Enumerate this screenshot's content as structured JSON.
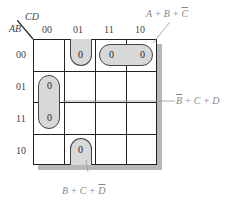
{
  "kmap": {
    "row_var": "AB",
    "col_var": "CD",
    "col_headers": [
      "00",
      "01",
      "11",
      "10"
    ],
    "row_headers": [
      "00",
      "01",
      "11",
      "10"
    ],
    "cells": [
      [
        "",
        "0",
        "0",
        "0"
      ],
      [
        "0",
        "",
        "",
        ""
      ],
      [
        "0",
        "",
        "",
        ""
      ],
      [
        "",
        "0",
        "",
        ""
      ]
    ]
  },
  "groups": [
    {
      "label_parts": [
        "A + B + ",
        "C"
      ],
      "cells": "00-11,00-10"
    },
    {
      "label_parts": [
        "B",
        " + C + D"
      ],
      "cells": "01-00,11-00"
    },
    {
      "label_parts": [
        "B + C + ",
        "D"
      ],
      "cells": "00-01,10-01 (wrap)"
    }
  ]
}
